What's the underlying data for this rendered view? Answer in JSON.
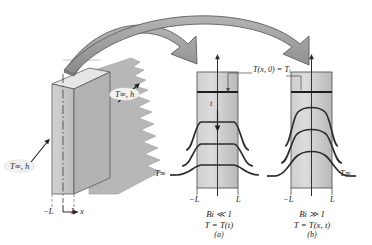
{
  "figure": {
    "slab": {
      "left_boundary_label": "−L",
      "right_boundary_label": "L",
      "axis_label": "x",
      "fluid_label_upper": "T∞, h",
      "fluid_label_lower": "T∞, h"
    },
    "panels": [
      {
        "id": "a",
        "panel_tag": "(a)",
        "biot_condition": "Bi ≪ 1",
        "temperature_relation": "T = T(t)",
        "left_boundary_label": "−L",
        "right_boundary_label": "L",
        "ambient_label": "T∞",
        "initial_condition_label": "T(x, 0) = T",
        "initial_condition_subscript": "i",
        "time_arrow_label": "t",
        "curve_description": "nearly uniform (flat) temperature profiles dropping steeply at the surfaces"
      },
      {
        "id": "b",
        "panel_tag": "(b)",
        "biot_condition": "Bi ≫ 1",
        "temperature_relation": "T = T(x, t)",
        "left_boundary_label": "−L",
        "right_boundary_label": "L",
        "ambient_label": "T∞",
        "curve_description": "parabolic temperature profiles with strong internal gradients"
      }
    ],
    "colors": {
      "slab_front_face": "#c9c9c9",
      "slab_side_face": "#b0b0b0",
      "slab_top_face": "#e3e3e3",
      "wall_fill_light": "#d8d8d8",
      "wall_fill_dark": "#bdbdbd",
      "arrow_fill": "#9a9a9a",
      "arrow_stroke": "#5d5d5d",
      "curve_stroke": "#2b2b2b",
      "outline": "#4a4a4a",
      "text": "#1a1a1a",
      "background": "#ffffff"
    }
  }
}
